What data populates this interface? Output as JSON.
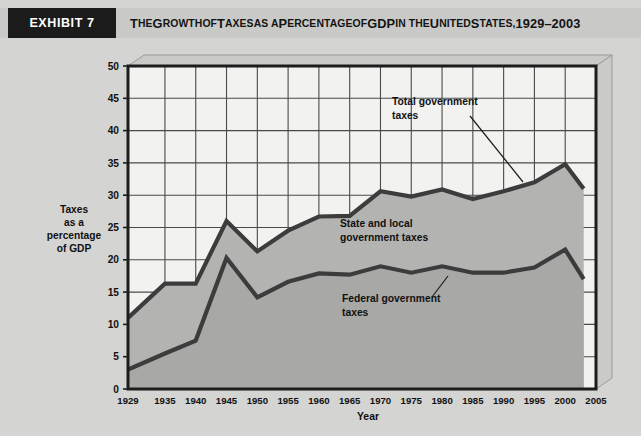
{
  "exhibit": {
    "tag": "EXHIBIT 7",
    "title_parts": [
      {
        "t": "T",
        "big": true
      },
      {
        "t": "HE ",
        "big": false
      },
      {
        "t": "G",
        "big": true
      },
      {
        "t": "ROWTH ",
        "big": false
      },
      {
        "t": "OF ",
        "big": false
      },
      {
        "t": "T",
        "big": true
      },
      {
        "t": "AXES ",
        "big": false
      },
      {
        "t": "AS A ",
        "big": false
      },
      {
        "t": "P",
        "big": true
      },
      {
        "t": "ERCENTAGE ",
        "big": false
      },
      {
        "t": "OF ",
        "big": false
      },
      {
        "t": "GDP ",
        "big": true
      },
      {
        "t": "IN THE ",
        "big": false
      },
      {
        "t": "U",
        "big": true
      },
      {
        "t": "NITED ",
        "big": false
      },
      {
        "t": "S",
        "big": true
      },
      {
        "t": "TATES, ",
        "big": false
      },
      {
        "t": "1929–2003",
        "big": true
      }
    ],
    "title_plain": "THE GROWTH OF TAXES AS A PERCENTAGE OF GDP IN THE UNITED STATES, 1929–2003"
  },
  "axis": {
    "y_title_lines": [
      "Taxes",
      "as a",
      "percentage",
      "of GDP"
    ],
    "x_title": "Year"
  },
  "footnote": "",
  "colors": {
    "page_background": "#d4d4d2",
    "header_band": "#c9c9c7",
    "tag_background": "#1b1b1b",
    "tag_text": "#ffffff",
    "plot_background": "#f2f2f0",
    "area_fill": "#b0b0ae",
    "line_stroke": "#3c3c3c",
    "grid": "#4a4a4a",
    "frame": "#1c1c1c"
  },
  "chart_data": {
    "type": "area",
    "title": "The Growth of Taxes as a Percentage of GDP in the United States, 1929–2003",
    "xlabel": "Year",
    "ylabel": "Taxes as a percentage of GDP",
    "xlim": [
      1929,
      2005
    ],
    "ylim": [
      0,
      50
    ],
    "y_ticks": [
      0,
      5,
      10,
      15,
      20,
      25,
      30,
      35,
      40,
      45,
      50
    ],
    "x_ticks": [
      1929,
      1935,
      1940,
      1945,
      1950,
      1955,
      1960,
      1965,
      1970,
      1975,
      1980,
      1985,
      1990,
      1995,
      2000,
      2005
    ],
    "grid": true,
    "legend_position": "inline-annotations",
    "x": [
      1929,
      1935,
      1940,
      1945,
      1950,
      1955,
      1960,
      1965,
      1970,
      1975,
      1980,
      1985,
      1990,
      1995,
      2000,
      2003
    ],
    "series": [
      {
        "name": "Total government taxes",
        "values": [
          11.0,
          16.3,
          16.3,
          26.0,
          21.3,
          24.5,
          26.7,
          26.8,
          30.6,
          29.8,
          30.9,
          29.4,
          30.6,
          32.0,
          34.8,
          31.0
        ]
      },
      {
        "name": "Federal government taxes",
        "values": [
          3.0,
          5.5,
          7.5,
          20.3,
          14.2,
          16.6,
          17.9,
          17.7,
          19.0,
          18.0,
          19.0,
          18.0,
          18.0,
          18.8,
          21.6,
          17.0
        ]
      }
    ],
    "annotations": [
      {
        "id": "total-government-taxes",
        "lines": [
          "Total government",
          "taxes"
        ],
        "leader": true
      },
      {
        "id": "state-and-local-government-taxes",
        "lines": [
          "State and local",
          "government taxes"
        ],
        "leader": false
      },
      {
        "id": "federal-government-taxes",
        "lines": [
          "Federal government",
          "taxes"
        ],
        "leader": true
      }
    ]
  }
}
